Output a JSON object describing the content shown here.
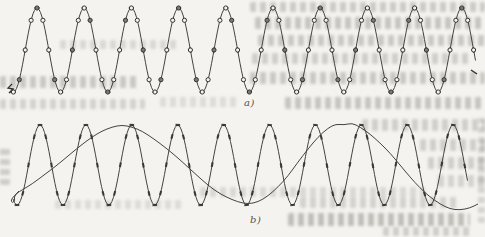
{
  "figure": {
    "panel_a_label": "a)",
    "panel_b_label": "b)",
    "ink_color": "#45433f",
    "marker_ink_color": "#35332f",
    "paper_color": "#f4f3f0",
    "smudge_color": "#96928a"
  },
  "chart_data": [
    {
      "type": "line",
      "panel": "a",
      "panel_label": "a)",
      "title": "",
      "xlabel": "",
      "ylabel": "",
      "axes_shown": false,
      "grid": false,
      "legend": null,
      "description": "Sinusoid of about 10 cycles sampled densely; each sample shown as a small open circle on the waveform (adequate sampling rate).",
      "series": [
        {
          "name": "sampled-sinusoid",
          "style": "solid",
          "marker": "open-circle",
          "cycles": 10,
          "period_px": 47.2,
          "first_peak_x_px": 37,
          "x_start_px": 12,
          "x_end_px": 476,
          "center_y_px": 50,
          "amplitude_px": 42,
          "marker_spacing_px": 5.9,
          "marker_radius_px": 2.1
        }
      ],
      "pen_artifact_points": [
        [
          12,
          84
        ],
        [
          8,
          88
        ],
        [
          13,
          89
        ],
        [
          9,
          93
        ],
        [
          14,
          90
        ]
      ],
      "end_tick": [
        [
          471,
          70
        ],
        [
          477,
          74
        ]
      ]
    },
    {
      "type": "line",
      "panel": "b",
      "panel_label": "b)",
      "title": "",
      "xlabel": "",
      "ylabel": "",
      "axes_shown": false,
      "grid": false,
      "legend": null,
      "description": "High-frequency sinusoid of about 10 cycles with short sample tick marks, overlaid with the slow aliased sinusoid of about 2 cycles that passes through the same sample instants (undersampling / aliasing).",
      "series": [
        {
          "name": "high-frequency-sinusoid",
          "style": "solid",
          "marker": "tick",
          "cycles": 10,
          "period_px": 45.9,
          "first_peak_x_px": 40,
          "x_start_px": 13,
          "x_end_px": 468,
          "center_y_px": 165,
          "amplitude_px": 40,
          "marker_spacing_px": 5.74,
          "tick_half_length_px": 2.3
        },
        {
          "name": "aliased-low-frequency-sinusoid",
          "style": "solid",
          "marker": "none",
          "cycles": 2.1,
          "points_px": [
            [
              19,
              191
            ],
            [
              14,
              196
            ],
            [
              11,
              200
            ],
            [
              12,
              203
            ],
            [
              15,
              201
            ],
            [
              14,
              197
            ],
            [
              17,
              193
            ],
            [
              22,
              190
            ],
            [
              32,
              184
            ],
            [
              44,
              175
            ],
            [
              56,
              166
            ],
            [
              68,
              156
            ],
            [
              80,
              146
            ],
            [
              92,
              137
            ],
            [
              102,
              131
            ],
            [
              112,
              127
            ],
            [
              122,
              125
            ],
            [
              132,
              127
            ],
            [
              142,
              131
            ],
            [
              154,
              139
            ],
            [
              166,
              148
            ],
            [
              178,
              158
            ],
            [
              190,
              169
            ],
            [
              202,
              180
            ],
            [
              214,
              190
            ],
            [
              226,
              197
            ],
            [
              238,
              202
            ],
            [
              248,
              204
            ],
            [
              258,
              202
            ],
            [
              268,
              196
            ],
            [
              278,
              187
            ],
            [
              288,
              176
            ],
            [
              298,
              162
            ],
            [
              308,
              149
            ],
            [
              318,
              137
            ],
            [
              328,
              128
            ],
            [
              336,
              124
            ],
            [
              344,
              125
            ],
            [
              352,
              123
            ],
            [
              360,
              127
            ],
            [
              370,
              134
            ],
            [
              380,
              143
            ],
            [
              390,
              153
            ],
            [
              400,
              165
            ],
            [
              410,
              177
            ],
            [
              420,
              188
            ],
            [
              430,
              197
            ],
            [
              440,
              204
            ],
            [
              450,
              209
            ],
            [
              460,
              210
            ],
            [
              470,
              208
            ],
            [
              478,
              204
            ]
          ]
        }
      ]
    }
  ]
}
